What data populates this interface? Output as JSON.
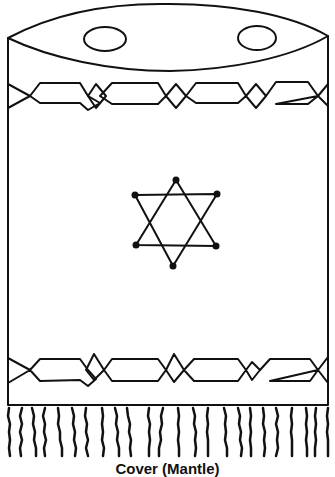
{
  "caption": "Cover (Mantle)",
  "figure": {
    "parts": [
      "top-ellipse",
      "finial-holes",
      "upper-border-band",
      "star-of-david",
      "lower-border-band",
      "fringe"
    ],
    "stroke_color": "#111111",
    "background": "#ffffff"
  }
}
